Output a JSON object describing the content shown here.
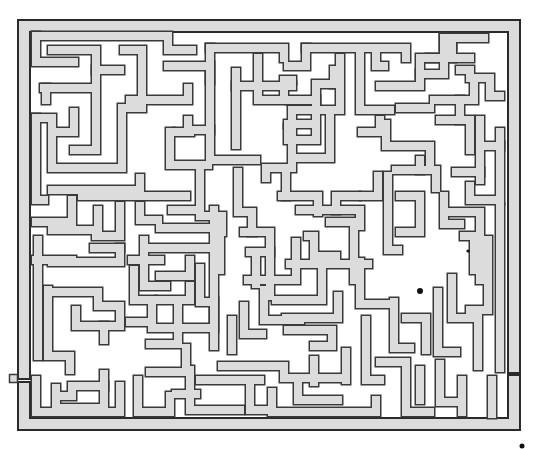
{
  "puzzle": {
    "type": "maze",
    "title": "",
    "wall_color": "#dcdcdc",
    "wall_outline_color": "#3a3a3a",
    "background_color": "#ffffff",
    "entry_marker": {
      "x": 9,
      "y": 374,
      "size": 8,
      "side": "left"
    },
    "exit": {
      "side": "right",
      "y_from": 367,
      "y_to": 381
    },
    "dots": [
      {
        "x": 468,
        "y": 251,
        "r": 1.6
      },
      {
        "x": 420,
        "y": 291,
        "r": 3
      },
      {
        "x": 522,
        "y": 446,
        "r": 2.5
      }
    ]
  }
}
